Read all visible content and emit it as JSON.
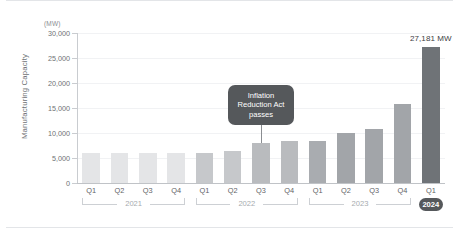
{
  "chart_data": {
    "type": "bar",
    "title": "",
    "subtitle": "",
    "xlabel": "",
    "ylabel": "Manufacturing Capacity",
    "unit_label": "(MW)",
    "ylim": [
      0,
      30000
    ],
    "ytick_labels": [
      "30,000",
      "25,000",
      "20,000",
      "15,000",
      "10,000",
      "5,000",
      "0"
    ],
    "ytick_values": [
      30000,
      25000,
      20000,
      15000,
      10000,
      5000,
      0
    ],
    "grid": true,
    "legend": "none",
    "categories": [
      "Q1",
      "Q2",
      "Q3",
      "Q4",
      "Q1",
      "Q2",
      "Q3",
      "Q4",
      "Q1",
      "Q2",
      "Q3",
      "Q4",
      "Q1"
    ],
    "values": [
      6000,
      6000,
      6000,
      6000,
      6100,
      6500,
      8000,
      8400,
      8500,
      10000,
      10800,
      15800,
      27181
    ],
    "bar_colors": [
      "#e4e5e7",
      "#e4e5e7",
      "#e4e5e7",
      "#e4e5e7",
      "#c6c8cb",
      "#c6c8cb",
      "#b9bbbe",
      "#b9bbbe",
      "#a9acb0",
      "#a2a5a9",
      "#a2a5a9",
      "#a2a5a9",
      "#6f7377"
    ],
    "groups": [
      {
        "label": "2021",
        "start": 0,
        "end": 3,
        "style": "bracket"
      },
      {
        "label": "2022",
        "start": 4,
        "end": 7,
        "style": "bracket"
      },
      {
        "label": "2023",
        "start": 8,
        "end": 11,
        "style": "bracket"
      },
      {
        "label": "2024",
        "start": 12,
        "end": 12,
        "style": "pill"
      }
    ],
    "annotations": [
      {
        "text": "Inflation Reduction Act passes",
        "lines": [
          "Inflation",
          "Reduction Act",
          "passes"
        ],
        "target_index": 6,
        "background": "#55585b",
        "text_color": "#ffffff"
      }
    ],
    "data_labels": [
      {
        "index": 12,
        "text": "27,181 MW"
      }
    ],
    "colors": {
      "grid": "#f1f2f4",
      "axis": "#c0c3c7",
      "tick_text": "#6e7174",
      "year_text": "#a7abaf",
      "pill_background": "#55585b",
      "highlight_bar": "#6f7377"
    }
  }
}
